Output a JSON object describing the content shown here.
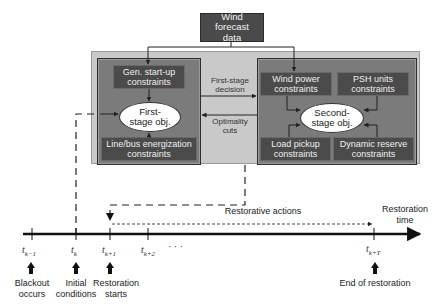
{
  "diagram": {
    "input": {
      "label": "Wind forecast data"
    },
    "first_stage": {
      "boxes": [
        {
          "id": "gen-startup",
          "label": "Gen. start-up constraints"
        },
        {
          "id": "line-bus",
          "label": "Line/bus energization constraints"
        }
      ],
      "objective": "First-stage obj."
    },
    "second_stage": {
      "boxes": [
        {
          "id": "wind-power",
          "label": "Wind power constraints"
        },
        {
          "id": "psh-units",
          "label": "PSH units constraints"
        },
        {
          "id": "load-pickup",
          "label": "Load pickup constraints"
        },
        {
          "id": "dynamic-reserve",
          "label": "Dynamic reserve constraints"
        }
      ],
      "objective": "Second-stage obj."
    },
    "links": {
      "forward": "First-stage decision",
      "backward": "Optimality cuts"
    }
  },
  "timeline": {
    "axis_label": "Restoration time",
    "span_label": "Restorative actions",
    "ticks": [
      {
        "base": "t",
        "sub": "k−1"
      },
      {
        "base": "t",
        "sub": "k"
      },
      {
        "base": "t",
        "sub": "k+1"
      },
      {
        "base": "t",
        "sub": "k+2"
      },
      {
        "base": "",
        "sub": "· · ·"
      },
      {
        "base": "t",
        "sub": "k+T"
      }
    ],
    "events": [
      {
        "label_line1": "Blackout",
        "label_line2": "occurs"
      },
      {
        "label_line1": "Initial",
        "label_line2": "conditions"
      },
      {
        "label_line1": "Restoration",
        "label_line2": "starts"
      },
      {
        "label_line1": "End of restoration",
        "label_line2": ""
      }
    ]
  },
  "colors": {
    "dark_box": "#4a4a4a",
    "panel": "#7b7b7b",
    "outer_frame": "#c9c9c9",
    "ellipse": "#ffffff",
    "line": "#222222"
  }
}
